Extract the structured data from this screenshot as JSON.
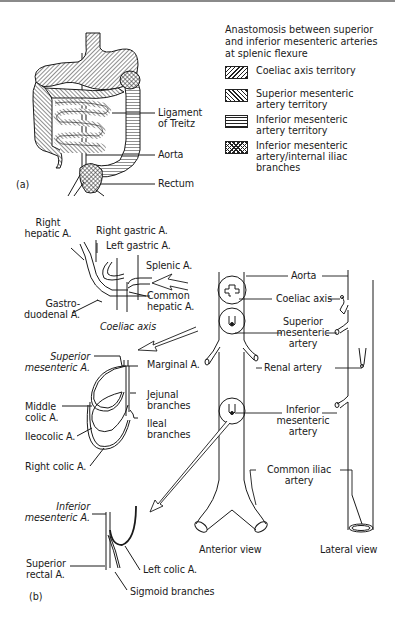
{
  "figure": {
    "panel_a_label": "(a)",
    "panel_b_label": "(b)"
  },
  "legend": {
    "title_lines": [
      "Anastomosis between superior",
      "and inferior mesenteric arteries",
      "at splenic flexure"
    ],
    "items": [
      {
        "pattern": "diagonal-hatch-right",
        "lines": [
          "Coeliac axis territory"
        ]
      },
      {
        "pattern": "diagonal-hatch-left",
        "lines": [
          "Superior mesenteric",
          "artery territory"
        ]
      },
      {
        "pattern": "horizontal-lines",
        "lines": [
          "Inferior mesenteric",
          "artery territory"
        ]
      },
      {
        "pattern": "cross-hatch",
        "lines": [
          "Inferior mesenteric",
          "artery/internal iliac",
          "branches"
        ]
      }
    ]
  },
  "panel_a": {
    "labels": {
      "ligament_1": "Ligament",
      "ligament_2": "of Treitz",
      "aorta": "Aorta",
      "rectum": "Rectum"
    }
  },
  "coeliac_detail": {
    "caption": "Coeliac axis",
    "labels": {
      "right_hepatic_1": "Right",
      "right_hepatic_2": "hepatic A.",
      "right_gastric": "Right gastric A.",
      "left_gastric": "Left gastric A.",
      "splenic": "Splenic A.",
      "common_hepatic_1": "Common",
      "common_hepatic_2": "hepatic A.",
      "gastroduodenal_1": "Gastro-",
      "gastroduodenal_2": "duodenal A."
    }
  },
  "sma_detail": {
    "labels": {
      "sma_1": "Superior",
      "sma_2": "mesenteric A.",
      "marginal": "Marginal A.",
      "jejunal_1": "Jejunal",
      "jejunal_2": "branches",
      "middle_colic_1": "Middle",
      "middle_colic_2": "colic A.",
      "ileal_1": "Ileal",
      "ileal_2": "branches",
      "ileocolic": "Ileocolic A.",
      "right_colic": "Right colic A."
    }
  },
  "ima_detail": {
    "labels": {
      "ima_1": "Inferior",
      "ima_2": "mesenteric A.",
      "superior_rectal_1": "Superior",
      "superior_rectal_2": "rectal A.",
      "left_colic": "Left colic A.",
      "sigmoid": "Sigmoid branches"
    }
  },
  "aorta_views": {
    "labels": {
      "aorta": "Aorta",
      "coeliac_axis": "Coeliac axis",
      "sma_1": "Superior",
      "sma_2": "mesenteric",
      "sma_3": "artery",
      "renal": "Renal artery",
      "ima_1": "Inferior",
      "ima_2": "mesenteric",
      "ima_3": "artery",
      "common_iliac_1": "Common iliac",
      "common_iliac_2": "artery"
    },
    "anterior_caption": "Anterior view",
    "lateral_caption": "Lateral view"
  }
}
